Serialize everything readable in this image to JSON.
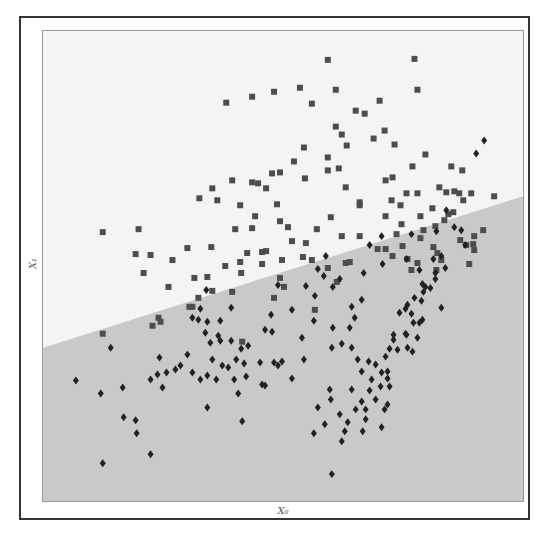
{
  "chart_data": {
    "type": "scatter",
    "title": "",
    "xlabel": "X₀",
    "ylabel": "X₁",
    "grid": false,
    "legend": null,
    "coordinate_space": "plot pixels (origin top-left of plot area, 482x472)",
    "decision_boundary": {
      "type": "line",
      "from": [
        0,
        318
      ],
      "to": [
        482,
        166
      ],
      "region_above_color": "#f4f4f4",
      "region_below_color": "#c9c9c9"
    },
    "series": [
      {
        "name": "class 0",
        "marker": "square",
        "color": "#4d4d4d",
        "points": [
          [
            286,
            29
          ],
          [
            373,
            28
          ],
          [
            232,
            61
          ],
          [
            258,
            57
          ],
          [
            294,
            59
          ],
          [
            376,
            59
          ],
          [
            184,
            72
          ],
          [
            210,
            66
          ],
          [
            270,
            73
          ],
          [
            323,
            83
          ],
          [
            338,
            70
          ],
          [
            314,
            80
          ],
          [
            300,
            104
          ],
          [
            332,
            108
          ],
          [
            262,
            117
          ],
          [
            294,
            96
          ],
          [
            305,
            115
          ],
          [
            286,
            127
          ],
          [
            343,
            100
          ],
          [
            353,
            114
          ],
          [
            252,
            131
          ],
          [
            304,
            157
          ],
          [
            318,
            172
          ],
          [
            344,
            150
          ],
          [
            410,
            136
          ],
          [
            351,
            147
          ],
          [
            297,
            138
          ],
          [
            286,
            140
          ],
          [
            263,
            148
          ],
          [
            238,
            142
          ],
          [
            230,
            143
          ],
          [
            224,
            158
          ],
          [
            210,
            152
          ],
          [
            216,
            153
          ],
          [
            190,
            150
          ],
          [
            170,
            158
          ],
          [
            175,
            170
          ],
          [
            157,
            168
          ],
          [
            198,
            175
          ],
          [
            213,
            186
          ],
          [
            235,
            174
          ],
          [
            210,
            198
          ],
          [
            193,
            199
          ],
          [
            250,
            211
          ],
          [
            238,
            191
          ],
          [
            224,
            221
          ],
          [
            264,
            213
          ],
          [
            246,
            197
          ],
          [
            289,
            187
          ],
          [
            275,
            199
          ],
          [
            300,
            206
          ],
          [
            318,
            206
          ],
          [
            286,
            238
          ],
          [
            270,
            230
          ],
          [
            205,
            223
          ],
          [
            220,
            234
          ],
          [
            190,
            262
          ],
          [
            198,
            232
          ],
          [
            242,
            257
          ],
          [
            165,
            247
          ],
          [
            170,
            261
          ],
          [
            126,
            257
          ],
          [
            116,
            288
          ],
          [
            101,
            243
          ],
          [
            145,
            218
          ],
          [
            108,
            225
          ],
          [
            93,
            224
          ],
          [
            60,
            202
          ],
          [
            238,
            248
          ],
          [
            308,
            232
          ],
          [
            261,
            227
          ],
          [
            336,
            219
          ],
          [
            355,
            204
          ],
          [
            382,
            200
          ],
          [
            396,
            223
          ],
          [
            379,
            208
          ],
          [
            344,
            186
          ],
          [
            359,
            175
          ],
          [
            365,
            163
          ],
          [
            376,
            163
          ],
          [
            350,
            170
          ],
          [
            360,
            194
          ],
          [
            376,
            233
          ],
          [
            394,
            196
          ],
          [
            405,
            162
          ],
          [
            418,
            163
          ],
          [
            421,
            140
          ],
          [
            398,
            157
          ],
          [
            391,
            178
          ],
          [
            407,
            184
          ],
          [
            430,
            163
          ],
          [
            403,
            190
          ],
          [
            318,
            175
          ],
          [
            295,
            252
          ],
          [
            273,
            280
          ],
          [
            232,
            268
          ],
          [
            304,
            233
          ],
          [
            220,
            222
          ],
          [
            130,
            230
          ],
          [
            152,
            248
          ],
          [
            147,
            277
          ],
          [
            118,
            292
          ],
          [
            96,
            199
          ],
          [
            199,
            243
          ],
          [
            169,
            217
          ],
          [
            183,
            236
          ],
          [
            200,
            312
          ],
          [
            156,
            268
          ],
          [
            150,
            277
          ],
          [
            110,
            296
          ],
          [
            60,
            304
          ],
          [
            240,
            230
          ],
          [
            413,
            161
          ],
          [
            422,
            170
          ],
          [
            425,
            215
          ],
          [
            432,
            214
          ],
          [
            433,
            206
          ],
          [
            442,
            200
          ],
          [
            412,
            182
          ],
          [
            371,
            136
          ],
          [
            384,
            124
          ],
          [
            453,
            166
          ],
          [
            419,
            210
          ],
          [
            428,
            234
          ],
          [
            433,
            220
          ],
          [
            344,
            219
          ],
          [
            351,
            226
          ],
          [
            370,
            240
          ],
          [
            379,
            186
          ],
          [
            395,
            240
          ],
          [
            366,
            229
          ],
          [
            361,
            216
          ],
          [
            392,
            217
          ],
          [
            400,
            230
          ]
        ]
      },
      {
        "name": "class 1",
        "marker": "diamond",
        "color": "#222222",
        "points": [
          [
            443,
            110
          ],
          [
            435,
            123
          ],
          [
            405,
            180
          ],
          [
            370,
            204
          ],
          [
            340,
            206
          ],
          [
            328,
            215
          ],
          [
            341,
            234
          ],
          [
            322,
            243
          ],
          [
            400,
            278
          ],
          [
            424,
            215
          ],
          [
            420,
            200
          ],
          [
            413,
            197
          ],
          [
            404,
            238
          ],
          [
            394,
            249
          ],
          [
            384,
            257
          ],
          [
            373,
            268
          ],
          [
            366,
            275
          ],
          [
            358,
            283
          ],
          [
            370,
            284
          ],
          [
            378,
            293
          ],
          [
            381,
            290
          ],
          [
            389,
            258
          ],
          [
            394,
            243
          ],
          [
            392,
            229
          ],
          [
            378,
            240
          ],
          [
            382,
            262
          ],
          [
            380,
            271
          ],
          [
            372,
            293
          ],
          [
            364,
            304
          ],
          [
            352,
            310
          ],
          [
            348,
            319
          ],
          [
            356,
            320
          ],
          [
            344,
            327
          ],
          [
            334,
            335
          ],
          [
            320,
            342
          ],
          [
            327,
            332
          ],
          [
            340,
            343
          ],
          [
            330,
            350
          ],
          [
            339,
            357
          ],
          [
            328,
            361
          ],
          [
            320,
            372
          ],
          [
            314,
            380
          ],
          [
            324,
            390
          ],
          [
            321,
            402
          ],
          [
            340,
            398
          ],
          [
            346,
            375
          ],
          [
            324,
            380
          ],
          [
            348,
            357
          ],
          [
            346,
            349
          ],
          [
            346,
            342
          ],
          [
            289,
            370
          ],
          [
            298,
            385
          ],
          [
            306,
            393
          ],
          [
            303,
            402
          ],
          [
            300,
            412
          ],
          [
            290,
            445
          ],
          [
            352,
            305
          ],
          [
            364,
            279
          ],
          [
            366,
            318
          ],
          [
            371,
            322
          ],
          [
            365,
            305
          ],
          [
            376,
            308
          ],
          [
            290,
            318
          ],
          [
            272,
            291
          ],
          [
            260,
            308
          ],
          [
            230,
            302
          ],
          [
            223,
            300
          ],
          [
            202,
            334
          ],
          [
            194,
            330
          ],
          [
            180,
            336
          ],
          [
            170,
            330
          ],
          [
            176,
            306
          ],
          [
            145,
            325
          ],
          [
            117,
            328
          ],
          [
            108,
            350
          ],
          [
            80,
            358
          ],
          [
            33,
            351
          ],
          [
            58,
            364
          ],
          [
            68,
            318
          ],
          [
            81,
            388
          ],
          [
            94,
            404
          ],
          [
            93,
            391
          ],
          [
            120,
            358
          ],
          [
            115,
            345
          ],
          [
            150,
            288
          ],
          [
            108,
            425
          ],
          [
            165,
            378
          ],
          [
            165,
            292
          ],
          [
            200,
            392
          ],
          [
            250,
            349
          ],
          [
            262,
            330
          ],
          [
            236,
            336
          ],
          [
            240,
            332
          ],
          [
            218,
            333
          ],
          [
            206,
            316
          ],
          [
            199,
            319
          ],
          [
            189,
            311
          ],
          [
            178,
            311
          ],
          [
            168,
            313
          ],
          [
            163,
            303
          ],
          [
            156,
            290
          ],
          [
            124,
            343
          ],
          [
            133,
            340
          ],
          [
            138,
            336
          ],
          [
            150,
            343
          ],
          [
            158,
            350
          ],
          [
            165,
            346
          ],
          [
            174,
            350
          ],
          [
            186,
            338
          ],
          [
            192,
            350
          ],
          [
            204,
            347
          ],
          [
            164,
            260
          ],
          [
            158,
            279
          ],
          [
            178,
            291
          ],
          [
            189,
            278
          ],
          [
            229,
            285
          ],
          [
            236,
            255
          ],
          [
            250,
            280
          ],
          [
            264,
            256
          ],
          [
            273,
            266
          ],
          [
            282,
            246
          ],
          [
            291,
            257
          ],
          [
            298,
            249
          ],
          [
            284,
            226
          ],
          [
            276,
            239
          ],
          [
            310,
            277
          ],
          [
            320,
            270
          ],
          [
            313,
            288
          ],
          [
            308,
            298
          ],
          [
            291,
            298
          ],
          [
            300,
            314
          ],
          [
            232,
            333
          ],
          [
            220,
            355
          ],
          [
            223,
            356
          ],
          [
            196,
            364
          ],
          [
            60,
            434
          ],
          [
            288,
            360
          ],
          [
            310,
            360
          ],
          [
            276,
            378
          ],
          [
            272,
            404
          ],
          [
            283,
            395
          ],
          [
            316,
            330
          ],
          [
            310,
            318
          ],
          [
            334,
            370
          ],
          [
            343,
            380
          ],
          [
            365,
            229
          ],
          [
            381,
            254
          ],
          [
            395,
            201
          ],
          [
            400,
            226
          ]
        ]
      }
    ]
  }
}
